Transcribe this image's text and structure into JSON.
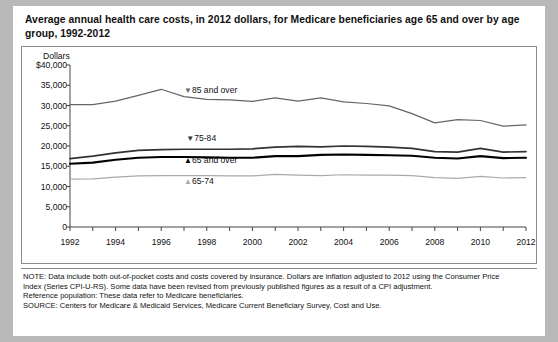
{
  "title": {
    "line1": "Average annual health care costs, in 2012 dollars, for Medicare beneficiaries age 65 and over",
    "line2": "by age group, 1992-2012"
  },
  "notes": [
    "NOTE: Data include both out-of-pocket costs and costs covered by insurance. Dollars are inflation adjusted to 2012 using the Consumer Price",
    "Index (Series CPI-U-RS). Some data have been revised from previously published figures as a result of a CPI adjustment.",
    "Reference population: These data refer to Medicare beneficiaries.",
    "SOURCE: Centers for Medicare & Medicaid Services, Medicare Current Beneficiary Survey, Cost and Use."
  ],
  "chart_data": {
    "type": "line",
    "title": "Average annual health care costs, in 2012 dollars, for Medicare beneficiaries age 65 and over by age group, 1992-2012",
    "xlabel": "",
    "ylabel": "Dollars",
    "ylim": [
      0,
      40000
    ],
    "xlim": [
      1992,
      2012
    ],
    "grid": false,
    "legend_position": "inline-annotations",
    "ytick_labels": [
      "$40,000",
      "35,000",
      "30,000",
      "25,000",
      "20,000",
      "15,000",
      "10,000",
      "5,000",
      "0"
    ],
    "ytick_values": [
      40000,
      35000,
      30000,
      25000,
      20000,
      15000,
      10000,
      5000,
      0
    ],
    "xtick_labels": [
      "1992",
      "1994",
      "1996",
      "1998",
      "2000",
      "2002",
      "2004",
      "2006",
      "2008",
      "2010",
      "2012"
    ],
    "xtick_values": [
      1992,
      1994,
      1996,
      1998,
      2000,
      2002,
      2004,
      2006,
      2008,
      2010,
      2012
    ],
    "x": [
      1992,
      1993,
      1994,
      1995,
      1996,
      1997,
      1998,
      1999,
      2000,
      2001,
      2002,
      2003,
      2004,
      2005,
      2006,
      2007,
      2008,
      2009,
      2010,
      2011,
      2012
    ],
    "series": [
      {
        "name": "85 and over",
        "marker": "▼",
        "color": "#666666",
        "width": 1.2,
        "label_x": 1997.0,
        "label_value": 33600,
        "values": [
          30200,
          30200,
          31100,
          32500,
          34000,
          32200,
          31500,
          31400,
          31000,
          31900,
          31100,
          31900,
          30900,
          30500,
          29900,
          28000,
          25700,
          26500,
          26300,
          24900,
          25200
        ]
      },
      {
        "name": "75-84",
        "marker": "▼",
        "color": "#333333",
        "width": 1.7,
        "label_x": 1997.1,
        "label_value": 21700,
        "values": [
          16900,
          17500,
          18300,
          18900,
          19100,
          19200,
          19200,
          19200,
          19300,
          19700,
          19900,
          19800,
          20000,
          19900,
          19700,
          19400,
          18600,
          18500,
          19400,
          18500,
          18600
        ]
      },
      {
        "name": "65 and over",
        "marker": "▲",
        "color": "#000000",
        "width": 2.1,
        "label_x": 1997.0,
        "label_value": 16300,
        "values": [
          15600,
          15900,
          16600,
          17100,
          17300,
          17300,
          17200,
          17100,
          17100,
          17500,
          17500,
          17800,
          17900,
          17800,
          17700,
          17600,
          17100,
          16900,
          17500,
          17000,
          17100
        ]
      },
      {
        "name": "65-74",
        "marker": "▲",
        "color": "#aaaaaa",
        "width": 1.2,
        "label_x": 1997.0,
        "label_value": 11100,
        "values": [
          11800,
          11900,
          12300,
          12600,
          12700,
          12700,
          12700,
          12600,
          12600,
          13000,
          12800,
          12700,
          12900,
          12800,
          12800,
          12700,
          12200,
          12000,
          12500,
          12100,
          12200
        ]
      }
    ]
  }
}
